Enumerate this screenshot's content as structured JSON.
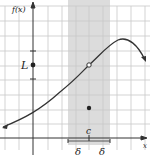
{
  "diagram": {
    "y_axis_label": "f(x)",
    "x_axis_label": "x",
    "limit_label": "L",
    "point_label": "c",
    "delta_left": "δ",
    "delta_right": "δ",
    "colors": {
      "grid": "#c8c8c8",
      "shade": "#d9d9d9",
      "curve": "#333333",
      "axis": "#333333"
    }
  }
}
